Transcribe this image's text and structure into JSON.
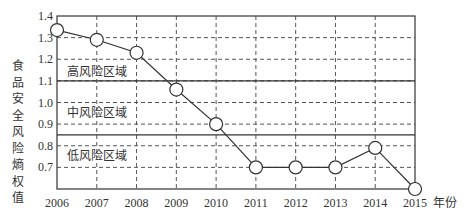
{
  "chart_data": {
    "type": "line",
    "title": "",
    "xlabel": "年份",
    "ylabel": "食品安全风险熵权值",
    "x": [
      "2006",
      "2007",
      "2008",
      "2009",
      "2010",
      "2011",
      "2012",
      "2013",
      "2014",
      "2015"
    ],
    "series": [
      {
        "name": "食品安全风险熵权值",
        "values": [
          1.335,
          1.29,
          1.23,
          1.06,
          0.9,
          0.7,
          0.7,
          0.7,
          0.79,
          0.6
        ]
      }
    ],
    "yticks": [
      0.7,
      0.8,
      0.9,
      1.0,
      1.1,
      1.2,
      1.3,
      1.4
    ],
    "ylim": [
      0.6,
      1.4
    ],
    "grid": true,
    "zones": [
      {
        "label": "高风险区域",
        "boundary_below": 1.1
      },
      {
        "label": "中风险区域",
        "boundary_below": 0.85
      },
      {
        "label": "低风险区域"
      }
    ],
    "zone_boundaries": [
      1.1,
      0.85
    ]
  },
  "labels": {
    "ylabel_chars": [
      "食",
      "品",
      "安",
      "全",
      "风",
      "险",
      "熵",
      "权",
      "值"
    ],
    "xunit": "年份",
    "zone_high": "高风险区域",
    "zone_mid": "中风险区域",
    "zone_low": "低风险区域"
  }
}
